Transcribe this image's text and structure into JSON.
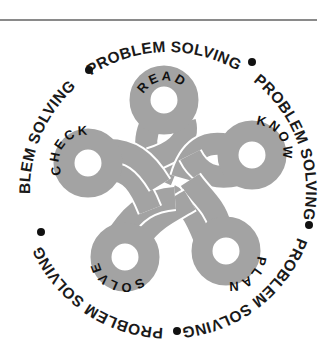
{
  "figure": {
    "title_ring": {
      "segments": [
        "PROBLEM SOLVING",
        "PROBLEM SOLVING",
        "PROBLEM SOLVING",
        "PROBLEM SOLVING",
        "PROBLEM SOLVING"
      ],
      "separator": "dot"
    },
    "loops": [
      {
        "label": "READ",
        "position": "top"
      },
      {
        "label": "KNOW",
        "position": "upper-right"
      },
      {
        "label": "PLAN",
        "position": "lower-right"
      },
      {
        "label": "SOLVE",
        "position": "lower-left"
      },
      {
        "label": "CHECK",
        "position": "upper-left"
      }
    ],
    "colors": {
      "rope": "#a3a3a3",
      "rope_edge": "#ffffff",
      "text": "#111111",
      "rule": "#8a8a8a"
    }
  }
}
